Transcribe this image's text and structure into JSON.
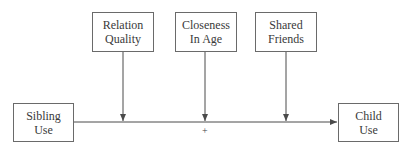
{
  "nodes": {
    "relation_quality": {
      "line1": "Relation",
      "line2": "Quality"
    },
    "closeness_in_age": {
      "line1": "Closeness",
      "line2": "In Age"
    },
    "shared_friends": {
      "line1": "Shared",
      "line2": "Friends"
    },
    "sibling_use": {
      "line1": "Sibling",
      "line2": "Use"
    },
    "child_use": {
      "line1": "Child",
      "line2": "Use"
    }
  },
  "edges": [
    {
      "from": "sibling_use",
      "to": "child_use",
      "label": "+"
    },
    {
      "from": "relation_quality",
      "to": "sibling_use->child_use",
      "label": ""
    },
    {
      "from": "closeness_in_age",
      "to": "sibling_use->child_use",
      "label": ""
    },
    {
      "from": "shared_friends",
      "to": "sibling_use->child_use",
      "label": ""
    }
  ],
  "main_path_label": "+",
  "colors": {
    "line": "#4a4a4a",
    "border": "#6a6a6a",
    "text": "#3a3a3a"
  }
}
